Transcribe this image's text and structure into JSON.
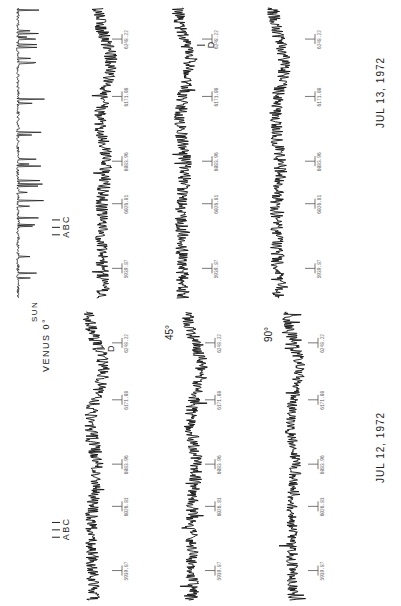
{
  "figure": {
    "orientation": "rotated 90 degrees clockwise (text reads bottom-to-top)",
    "top_panel": {
      "date": "JUL 13, 1972",
      "traces": [
        "SUN",
        "VENUS 0°",
        "VENUS 45°",
        "VENUS 90°"
      ],
      "line_markers": [
        "A",
        "B",
        "C",
        "D"
      ]
    },
    "bottom_panel": {
      "date": "JUL 12, 1972",
      "traces": [
        "VENUS 0°",
        "45°",
        "90°"
      ],
      "line_markers": [
        "A",
        "B",
        "C",
        "D"
      ]
    },
    "labels": {
      "sun": "SUN",
      "venus0": "VENUS 0°",
      "deg45": "45°",
      "deg90": "90°",
      "date_top": "JUL 13, 1972",
      "date_bottom": "JUL 12, 1972",
      "A": "A",
      "B": "B",
      "C": "C",
      "D": "D"
    }
  },
  "chart_data": {
    "type": "line",
    "title": "",
    "xlabel": "Wavelength / frequency marker",
    "ylabel": "Intensity (relative)",
    "tick_labels": [
      "5939.87",
      "6026.81",
      "6083.96",
      "6171.08",
      "6248.22"
    ],
    "tick_positions": [
      5939.87,
      6026.81,
      6083.96,
      6171.08,
      6248.22
    ],
    "xlim": [
      5900,
      6290
    ],
    "panels": [
      {
        "name": "JUL 13, 1972",
        "series": [
          {
            "name": "SUN",
            "shape": "flat baseline with sharp absorption lines",
            "noise": 0.15,
            "hump": 0.0
          },
          {
            "name": "VENUS 0°",
            "shape": "noisy with broad dip near D",
            "noise": 0.5,
            "hump": 0.6
          },
          {
            "name": "VENUS 45°",
            "shape": "noisy with broad dip near D",
            "noise": 0.5,
            "hump": 0.5
          },
          {
            "name": "VENUS 90°",
            "shape": "noisy with broad dip near D",
            "noise": 0.5,
            "hump": 0.5
          }
        ]
      },
      {
        "name": "JUL 12, 1972",
        "series": [
          {
            "name": "VENUS 0°",
            "shape": "noisy with broad dip near D",
            "noise": 0.5,
            "hump": 0.7
          },
          {
            "name": "45°",
            "shape": "noisy with broad dip near D",
            "noise": 0.5,
            "hump": 0.6
          },
          {
            "name": "90°",
            "shape": "noisy with broad dip near D",
            "noise": 0.45,
            "hump": 0.5
          }
        ]
      }
    ],
    "line_markers": [
      {
        "label": "A",
        "x": 5985
      },
      {
        "label": "B",
        "x": 5995
      },
      {
        "label": "C",
        "x": 6005
      },
      {
        "label": "D",
        "x": 6240
      }
    ],
    "grid": false,
    "legend": "none"
  }
}
